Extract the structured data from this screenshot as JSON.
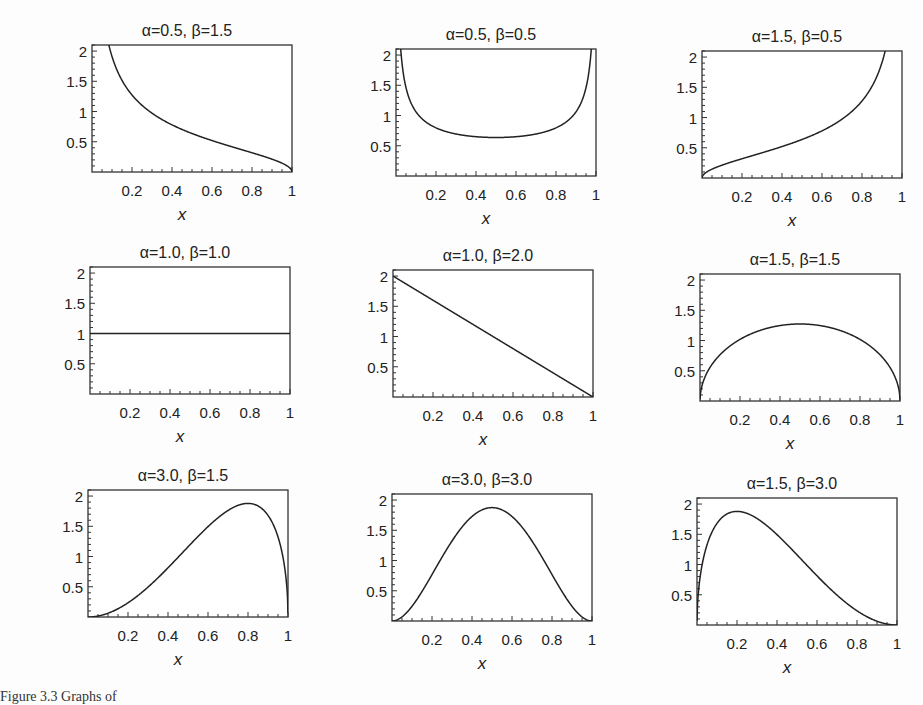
{
  "figure": {
    "caption": "Figure 3.3 Graphs of"
  },
  "chart_data": [
    {
      "type": "line",
      "title": "α=0.5, β=1.5",
      "alpha": 0.5,
      "beta": 1.5,
      "xlabel": "x",
      "ylabel": "f(x)",
      "xlim": [
        0,
        1
      ],
      "ylim": [
        0,
        2.1
      ],
      "xticks": [
        "0.2",
        "0.4",
        "0.6",
        "0.8",
        "1"
      ],
      "yticks": [
        "0.5",
        "1",
        "1.5",
        "2"
      ],
      "x": [
        0.08,
        0.1,
        0.2,
        0.3,
        0.4,
        0.5,
        0.6,
        0.7,
        0.8,
        0.9,
        1.0
      ],
      "y": [
        2.1,
        1.91,
        1.27,
        0.97,
        0.78,
        0.64,
        0.52,
        0.42,
        0.32,
        0.21,
        0.0
      ]
    },
    {
      "type": "line",
      "title": "α=0.5, β=0.5",
      "alpha": 0.5,
      "beta": 0.5,
      "xlabel": "x",
      "ylabel": "f(x)",
      "xlim": [
        0,
        1
      ],
      "ylim": [
        0,
        2.1
      ],
      "xticks": [
        "0.2",
        "0.4",
        "0.6",
        "0.8",
        "1"
      ],
      "yticks": [
        "0.5",
        "1",
        "1.5",
        "2"
      ],
      "x": [
        0.02,
        0.05,
        0.1,
        0.2,
        0.3,
        0.4,
        0.5,
        0.6,
        0.7,
        0.8,
        0.9,
        0.95,
        0.98
      ],
      "y": [
        2.27,
        1.46,
        1.06,
        0.8,
        0.69,
        0.65,
        0.64,
        0.65,
        0.69,
        0.8,
        1.06,
        1.46,
        2.27
      ]
    },
    {
      "type": "line",
      "title": "α=1.5, β=0.5",
      "alpha": 1.5,
      "beta": 0.5,
      "xlabel": "x",
      "ylabel": "f(x)",
      "xlim": [
        0,
        1
      ],
      "ylim": [
        0,
        2.1
      ],
      "xticks": [
        "0.2",
        "0.4",
        "0.6",
        "0.8",
        "1"
      ],
      "yticks": [
        "0.5",
        "1",
        "1.5",
        "2"
      ],
      "x": [
        0.0,
        0.1,
        0.2,
        0.3,
        0.4,
        0.5,
        0.6,
        0.7,
        0.8,
        0.9,
        0.92
      ],
      "y": [
        0.0,
        0.21,
        0.32,
        0.42,
        0.52,
        0.64,
        0.78,
        0.97,
        1.27,
        1.91,
        2.1
      ]
    },
    {
      "type": "line",
      "title": "α=1.0, β=1.0",
      "alpha": 1.0,
      "beta": 1.0,
      "xlabel": "x",
      "ylabel": "f(x)",
      "xlim": [
        0,
        1
      ],
      "ylim": [
        0,
        2.1
      ],
      "xticks": [
        "0.2",
        "0.4",
        "0.6",
        "0.8",
        "1"
      ],
      "yticks": [
        "0.5",
        "1",
        "1.5",
        "2"
      ],
      "x": [
        0.0,
        1.0
      ],
      "y": [
        1.0,
        1.0
      ]
    },
    {
      "type": "line",
      "title": "α=1.0, β=2.0",
      "alpha": 1.0,
      "beta": 2.0,
      "xlabel": "x",
      "ylabel": "f(x)",
      "xlim": [
        0,
        1
      ],
      "ylim": [
        0,
        2.1
      ],
      "xticks": [
        "0.2",
        "0.4",
        "0.6",
        "0.8",
        "1"
      ],
      "yticks": [
        "0.5",
        "1",
        "1.5",
        "2"
      ],
      "x": [
        0.0,
        1.0
      ],
      "y": [
        2.0,
        0.0
      ]
    },
    {
      "type": "line",
      "title": "α=1.5, β=1.5",
      "alpha": 1.5,
      "beta": 1.5,
      "xlabel": "x",
      "ylabel": "f(x)",
      "xlim": [
        0,
        1
      ],
      "ylim": [
        0,
        2.1
      ],
      "xticks": [
        "0.2",
        "0.4",
        "0.6",
        "0.8",
        "1"
      ],
      "yticks": [
        "0.5",
        "1",
        "1.5",
        "2"
      ],
      "x": [
        0.0,
        0.02,
        0.05,
        0.1,
        0.2,
        0.3,
        0.4,
        0.5,
        0.6,
        0.7,
        0.8,
        0.9,
        0.95,
        0.98,
        1.0
      ],
      "y": [
        0.0,
        0.22,
        0.35,
        0.48,
        0.64,
        0.73,
        0.78,
        0.79,
        0.78,
        0.73,
        0.64,
        0.48,
        0.35,
        0.22,
        0.0
      ],
      "y_scaled_note": "density = y * 1.6"
    },
    {
      "type": "line",
      "title": "α=3.0, β=1.5",
      "alpha": 3.0,
      "beta": 1.5,
      "xlabel": "x",
      "ylabel": "f(x)",
      "xlim": [
        0,
        1
      ],
      "ylim": [
        0,
        2.1
      ],
      "xticks": [
        "0.2",
        "0.4",
        "0.6",
        "0.8",
        "1"
      ],
      "yticks": [
        "0.5",
        "1",
        "1.5",
        "2"
      ],
      "x": [
        0.0,
        0.1,
        0.2,
        0.3,
        0.4,
        0.5,
        0.6,
        0.7,
        0.8,
        0.9,
        0.95,
        1.0
      ],
      "y": [
        0.0,
        0.03,
        0.13,
        0.28,
        0.48,
        0.76,
        1.09,
        1.44,
        1.76,
        1.73,
        1.35,
        0.0
      ]
    },
    {
      "type": "line",
      "title": "α=3.0, β=3.0",
      "alpha": 3.0,
      "beta": 3.0,
      "xlabel": "x",
      "ylabel": "f(x)",
      "xlim": [
        0,
        1
      ],
      "ylim": [
        0,
        2.1
      ],
      "xticks": [
        "0.2",
        "0.4",
        "0.6",
        "0.8",
        "1"
      ],
      "yticks": [
        "0.5",
        "1",
        "1.5",
        "2"
      ],
      "x": [
        0.0,
        0.1,
        0.2,
        0.3,
        0.4,
        0.5,
        0.6,
        0.7,
        0.8,
        0.9,
        1.0
      ],
      "y": [
        0.0,
        0.24,
        0.77,
        1.32,
        1.73,
        1.88,
        1.73,
        1.32,
        0.77,
        0.24,
        0.0
      ]
    },
    {
      "type": "line",
      "title": "α=1.5, β=3.0",
      "alpha": 1.5,
      "beta": 3.0,
      "xlabel": "x",
      "ylabel": "f(x)",
      "xlim": [
        0,
        1
      ],
      "ylim": [
        0,
        2.1
      ],
      "xticks": [
        "0.2",
        "0.4",
        "0.6",
        "0.8",
        "1"
      ],
      "yticks": [
        "0.5",
        "1",
        "1.5",
        "2"
      ],
      "x": [
        0.0,
        0.02,
        0.05,
        0.1,
        0.2,
        0.3,
        0.4,
        0.5,
        0.6,
        0.7,
        0.8,
        0.9,
        1.0
      ],
      "y": [
        0.0,
        0.79,
        1.19,
        1.5,
        1.76,
        1.73,
        1.54,
        1.23,
        0.87,
        0.52,
        0.24,
        0.06,
        0.0
      ]
    }
  ],
  "panels": [
    {
      "left": 60,
      "top": 0
    },
    {
      "left": 364,
      "top": 4
    },
    {
      "left": 670,
      "top": 6
    },
    {
      "left": 58,
      "top": 222
    },
    {
      "left": 361,
      "top": 225
    },
    {
      "left": 668,
      "top": 229
    },
    {
      "left": 56,
      "top": 445
    },
    {
      "left": 360,
      "top": 449
    },
    {
      "left": 665,
      "top": 453
    }
  ]
}
